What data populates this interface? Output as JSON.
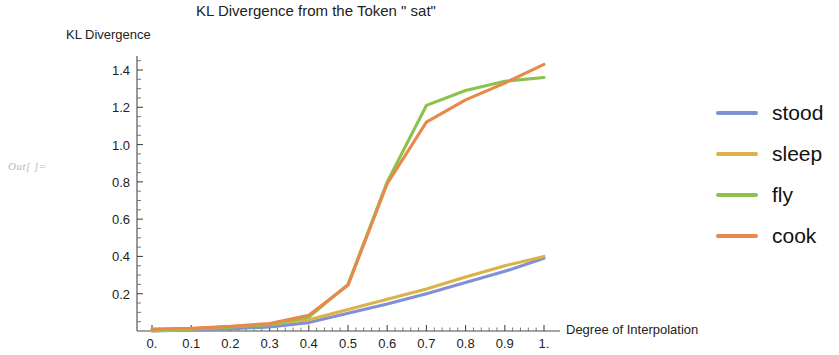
{
  "notebook": {
    "out_label": "Out[ ]="
  },
  "chart_data": {
    "type": "line",
    "title": "KL Divergence from the Token \" sat\"",
    "xlabel": "Degree of Interpolation",
    "ylabel": "KL Divergence",
    "xlim": [
      0,
      1
    ],
    "ylim": [
      0,
      1.5
    ],
    "xticks": [
      "0.",
      "0.1",
      "0.2",
      "0.3",
      "0.4",
      "0.5",
      "0.6",
      "0.7",
      "0.8",
      "0.9",
      "1."
    ],
    "xtick_values": [
      0,
      0.1,
      0.2,
      0.3,
      0.4,
      0.5,
      0.6,
      0.7,
      0.8,
      0.9,
      1.0
    ],
    "yticks": [
      "0.2",
      "0.4",
      "0.6",
      "0.8",
      "1.0",
      "1.2",
      "1.4"
    ],
    "ytick_values": [
      0.2,
      0.4,
      0.6,
      0.8,
      1.0,
      1.2,
      1.4
    ],
    "grid": false,
    "legend_position": "right",
    "x": [
      0,
      0.1,
      0.2,
      0.3,
      0.4,
      0.5,
      0.6,
      0.7,
      0.8,
      0.9,
      1.0
    ],
    "series": [
      {
        "name": "stood",
        "color": "#7d91d4",
        "values": [
          0.0,
          0.005,
          0.012,
          0.022,
          0.045,
          0.095,
          0.145,
          0.2,
          0.26,
          0.32,
          0.39
        ]
      },
      {
        "name": "sleep",
        "color": "#dcb14a",
        "values": [
          0.0,
          0.01,
          0.022,
          0.035,
          0.06,
          0.115,
          0.17,
          0.225,
          0.29,
          0.35,
          0.4
        ]
      },
      {
        "name": "fly",
        "color": "#8cc24a",
        "values": [
          0.005,
          0.012,
          0.022,
          0.035,
          0.075,
          0.25,
          0.8,
          1.21,
          1.29,
          1.34,
          1.36
        ]
      },
      {
        "name": "cook",
        "color": "#e8894c",
        "values": [
          0.01,
          0.015,
          0.025,
          0.04,
          0.085,
          0.245,
          0.79,
          1.12,
          1.24,
          1.33,
          1.43
        ]
      }
    ]
  },
  "legend": {
    "entries": [
      {
        "label": "stood",
        "color": "#7d91d4"
      },
      {
        "label": "sleep",
        "color": "#dcb14a"
      },
      {
        "label": "fly",
        "color": "#8cc24a"
      },
      {
        "label": "cook",
        "color": "#e8894c"
      }
    ]
  }
}
